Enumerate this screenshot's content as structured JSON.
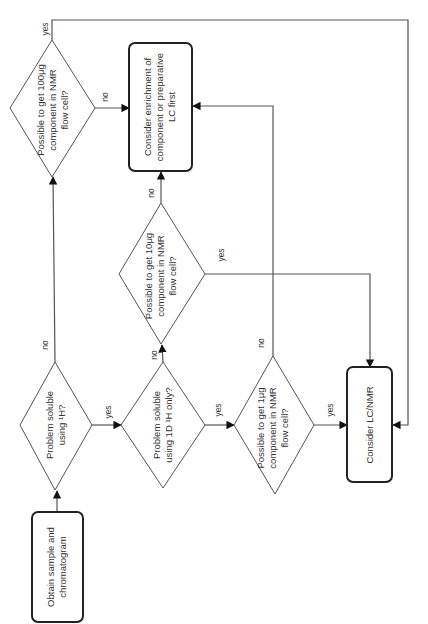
{
  "diagram": {
    "orientation": "rotated-90-ccw",
    "nodes": {
      "start": {
        "label_line1": "Obtain sample and",
        "label_line2": "chromatogram"
      },
      "soluble_1h": {
        "label_line1": "Problem soluble",
        "label_line2": "using ¹H?"
      },
      "soluble_1d": {
        "label_line1": "Problem soluble",
        "label_line2": "using 1D ¹H only?"
      },
      "get_1ug": {
        "label_line1": "Possible to get 1μg",
        "label_line2": "component in NMR",
        "label_line3": "flow cell?"
      },
      "get_10ug": {
        "label_line1": "Possible to get 10μg",
        "label_line2": "component in NMR",
        "label_line3": "flow cell?"
      },
      "get_100ug": {
        "label_line1": "Possible to get 100μg",
        "label_line2": "component in NMR",
        "label_line3": "flow cell?"
      },
      "enrichment": {
        "label_line1": "Consider enrichment of",
        "label_line2": "component or preparative",
        "label_line3": "LC first"
      },
      "lcnmr": {
        "label_line1": "Consider LC/NMR"
      }
    },
    "edges": {
      "soluble_1h_no": "no",
      "soluble_1h_yes": "yes",
      "soluble_1d_no": "no",
      "soluble_1d_yes": "yes",
      "get_1ug_no": "no",
      "get_1ug_yes": "yes",
      "get_10ug_no": "no",
      "get_10ug_yes": "yes",
      "get_100ug_no": "no",
      "get_100ug_yes": "yes"
    },
    "colors": {
      "line": "#555555",
      "box_border": "#222222",
      "text": "#333333",
      "background": "#ffffff"
    }
  }
}
